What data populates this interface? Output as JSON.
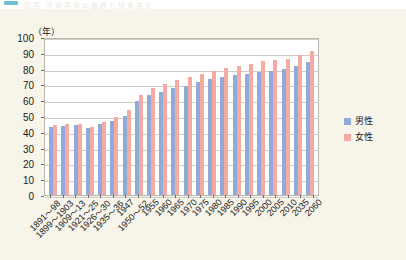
{
  "title_strip": {
    "ghost_text": "図表 平均寿命の推移と将来推計",
    "marker_color": "#6fc0cf"
  },
  "axis": {
    "unit_label": "（年）",
    "y_ticks": [
      "100",
      "90",
      "80",
      "70",
      "60",
      "50",
      "40",
      "30",
      "20",
      "10",
      "0"
    ],
    "ylim": [
      0,
      100
    ],
    "ystep": 10
  },
  "legend": {
    "items": [
      {
        "label": "男性",
        "color": "#92aad8"
      },
      {
        "label": "女性",
        "color": "#f4aba4"
      }
    ]
  },
  "chart_data": {
    "type": "bar",
    "title": "平均寿命の推移と将来推計",
    "xlabel": "",
    "ylabel": "（年）",
    "ylim": [
      0,
      100
    ],
    "grid": true,
    "legend_position": "right",
    "categories": [
      "1891～98",
      "1899～1903",
      "1909～13",
      "1921～25",
      "1926～30",
      "1935～36",
      "1947",
      "1950～52",
      "1955",
      "1960",
      "1965",
      "1970",
      "1975",
      "1980",
      "1985",
      "1990",
      "1995",
      "2000",
      "2005",
      "2010",
      "2035",
      "2060"
    ],
    "series": [
      {
        "name": "男性",
        "color": "#92aad8",
        "values": [
          42.8,
          43.9,
          44.2,
          42.1,
          44.8,
          46.9,
          50.1,
          59.6,
          63.6,
          65.3,
          67.7,
          69.3,
          71.7,
          73.4,
          74.8,
          75.9,
          76.4,
          77.7,
          78.6,
          79.6,
          81.9,
          84.2
        ]
      },
      {
        "name": "女性",
        "color": "#f4aba4",
        "values": [
          44.3,
          44.9,
          44.7,
          43.2,
          46.5,
          49.6,
          54.0,
          63.0,
          67.8,
          70.2,
          72.9,
          74.7,
          76.9,
          78.8,
          80.5,
          81.9,
          82.9,
          84.6,
          85.5,
          86.4,
          88.7,
          90.9
        ]
      }
    ]
  }
}
